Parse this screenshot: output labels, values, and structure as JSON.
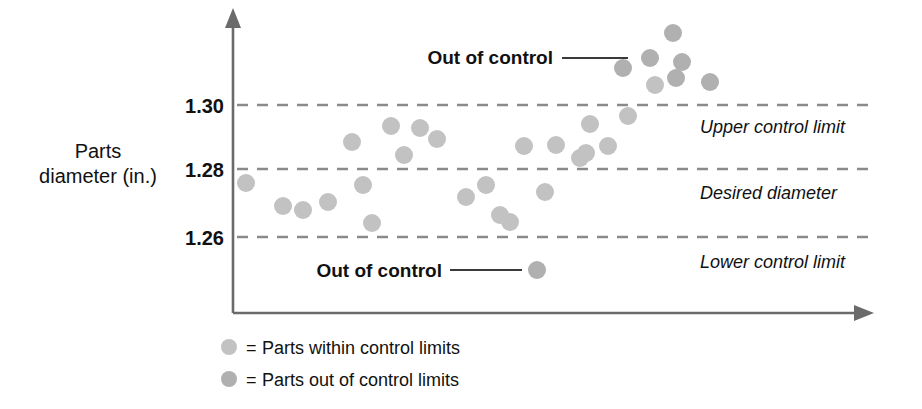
{
  "chart_data": {
    "type": "scatter",
    "title": "",
    "xlabel": "",
    "ylabel": "Parts diameter (in.)",
    "ylabel_line1": "Parts",
    "ylabel_line2": "diameter (in.)",
    "ytick_labels": [
      "1.30",
      "1.28",
      "1.26"
    ],
    "ytick_values": [
      1.3,
      1.28,
      1.26
    ],
    "ylim": [
      1.238,
      1.318
    ],
    "grid": "horizontal-dashed-at-control-limits",
    "legend_position": "below-axis-left",
    "control_limits": {
      "upper_control_limit": 1.3,
      "desired_diameter": 1.28,
      "lower_control_limit": 1.26
    },
    "limit_labels": [
      "Upper control limit",
      "Desired diameter",
      "Lower control limit"
    ],
    "annotations": [
      {
        "text": "Out of control",
        "points_to": "upper cluster above 1.30"
      },
      {
        "text": "Out of control",
        "points_to": "single point below 1.26"
      }
    ],
    "series": [
      {
        "name": "Parts within control limits",
        "color": "#c2c2c2",
        "values": [
          1.2765,
          1.2705,
          1.2695,
          1.2715,
          1.289,
          1.2765,
          1.264,
          1.2945,
          1.2855,
          1.294,
          1.29,
          1.2715,
          1.276,
          1.2665,
          1.2635,
          1.286,
          1.2745,
          1.288,
          1.283,
          1.284,
          1.295,
          1.287,
          1.2975,
          1.302
        ]
      },
      {
        "name": "Parts out of control limits",
        "color": "#b0b0b0",
        "values_above": [
          1.3075,
          1.3105,
          1.315,
          1.306,
          1.3085,
          1.304
        ],
        "values_below": [
          1.2495
        ]
      }
    ],
    "points_within": [
      {
        "x": 246,
        "y": 183
      },
      {
        "x": 283,
        "y": 206
      },
      {
        "x": 303,
        "y": 210
      },
      {
        "x": 328,
        "y": 202
      },
      {
        "x": 352,
        "y": 142
      },
      {
        "x": 363,
        "y": 185
      },
      {
        "x": 372,
        "y": 223
      },
      {
        "x": 391,
        "y": 126
      },
      {
        "x": 404,
        "y": 155
      },
      {
        "x": 420,
        "y": 128
      },
      {
        "x": 437,
        "y": 139
      },
      {
        "x": 466,
        "y": 197
      },
      {
        "x": 486,
        "y": 185
      },
      {
        "x": 500,
        "y": 215
      },
      {
        "x": 510,
        "y": 222
      },
      {
        "x": 524,
        "y": 146
      },
      {
        "x": 545,
        "y": 192
      },
      {
        "x": 556,
        "y": 145
      },
      {
        "x": 580,
        "y": 158
      },
      {
        "x": 586,
        "y": 153
      },
      {
        "x": 590,
        "y": 124
      },
      {
        "x": 608,
        "y": 146
      },
      {
        "x": 628,
        "y": 116
      },
      {
        "x": 655,
        "y": 85
      }
    ],
    "points_out_above": [
      {
        "x": 623,
        "y": 68
      },
      {
        "x": 650,
        "y": 58
      },
      {
        "x": 673,
        "y": 33
      },
      {
        "x": 676,
        "y": 78
      },
      {
        "x": 682,
        "y": 62
      },
      {
        "x": 710,
        "y": 82
      }
    ],
    "points_out_below": [
      {
        "x": 537,
        "y": 270
      }
    ]
  },
  "legend": {
    "items": [
      {
        "marker_color": "#c2c2c2",
        "equals": "=",
        "label": "Parts within control limits"
      },
      {
        "marker_color": "#b0b0b0",
        "equals": "=",
        "label": "Parts out of control limits"
      }
    ]
  },
  "axis": {
    "y_arrow": "up-arrow",
    "x_arrow": "right-arrow"
  }
}
